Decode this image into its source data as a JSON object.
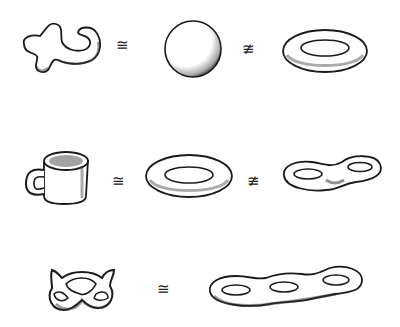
{
  "diagram": {
    "type": "topology-homeomorphism-illustration",
    "rows": [
      {
        "shapes": [
          "blob",
          "sphere",
          "torus"
        ],
        "relations": [
          {
            "symbol": "≅",
            "meaning": "homeomorphic"
          },
          {
            "symbol": "≇",
            "meaning": "not homeomorphic"
          }
        ]
      },
      {
        "shapes": [
          "coffee-mug",
          "torus",
          "double-torus"
        ],
        "relations": [
          {
            "symbol": "≅",
            "meaning": "homeomorphic"
          },
          {
            "symbol": "≇",
            "meaning": "not homeomorphic"
          }
        ]
      },
      {
        "shapes": [
          "pretzel",
          "triple-torus"
        ],
        "relations": [
          {
            "symbol": "≅",
            "meaning": "homeomorphic"
          }
        ]
      }
    ],
    "colors": {
      "ink": "#1a1a1a",
      "background": "#ffffff"
    }
  }
}
